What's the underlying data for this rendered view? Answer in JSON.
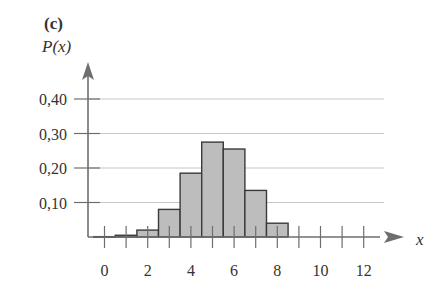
{
  "panel_label": "(c)",
  "chart_data": {
    "type": "bar",
    "title": "",
    "panel": "(c)",
    "xlabel": "x",
    "ylabel": "P(x)",
    "categories": [
      0,
      1,
      2,
      3,
      4,
      5,
      6,
      7,
      8,
      9,
      10,
      11,
      12
    ],
    "values": [
      0.001,
      0.005,
      0.02,
      0.08,
      0.185,
      0.275,
      0.255,
      0.135,
      0.04,
      0.0,
      0.0,
      0.0,
      0.0
    ],
    "x_tick_labels": [
      "0",
      "2",
      "4",
      "6",
      "8",
      "10",
      "12"
    ],
    "x_ticks": [
      0,
      2,
      4,
      6,
      8,
      10,
      12
    ],
    "y_tick_labels": [
      "0,10",
      "0,20",
      "0,30",
      "0,40"
    ],
    "y_ticks": [
      0.1,
      0.2,
      0.3,
      0.4
    ],
    "ylim": [
      0,
      0.45
    ],
    "xlim": [
      -0.75,
      13.5
    ],
    "grid": true,
    "legend": null,
    "style": "histogram with gray bars, arrowed axes"
  }
}
